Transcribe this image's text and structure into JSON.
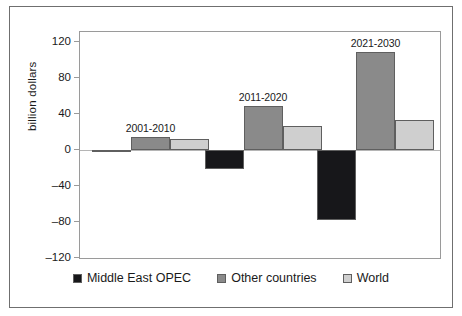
{
  "chart_data": {
    "type": "bar",
    "title": "",
    "xlabel": "",
    "ylabel": "billion dollars",
    "ylim": [
      -120,
      120
    ],
    "ytick_labels": [
      "120",
      "80",
      "40",
      "0",
      "–40",
      "–80",
      "–120"
    ],
    "ytick_values": [
      120,
      80,
      40,
      0,
      -40,
      -80,
      -120
    ],
    "grid": false,
    "legend_position": "bottom",
    "categories": [
      "2001-2010",
      "2011-2020",
      "2021-2030"
    ],
    "series": [
      {
        "name": "Middle East OPEC",
        "color": "#17171a",
        "values": [
          -2,
          -21,
          -78
        ]
      },
      {
        "name": "Other countries",
        "color": "#8a8a8a",
        "values": [
          14,
          49,
          109
        ]
      },
      {
        "name": "World",
        "color": "#cfcfcf",
        "values": [
          12,
          27,
          33
        ]
      }
    ]
  },
  "axis": {
    "y_title": "billion dollars"
  },
  "groups": [
    {
      "label": "2001-2010"
    },
    {
      "label": "2011-2020"
    },
    {
      "label": "2021-2030"
    }
  ],
  "legend": {
    "items": [
      {
        "label": "Middle East OPEC",
        "color": "#17171a"
      },
      {
        "label": "Other countries",
        "color": "#8a8a8a"
      },
      {
        "label": "World",
        "color": "#cfcfcf"
      }
    ]
  },
  "yticks": [
    {
      "label": "120",
      "value": 120
    },
    {
      "label": "80",
      "value": 80
    },
    {
      "label": "40",
      "value": 40
    },
    {
      "label": "0",
      "value": 0
    },
    {
      "label": "–40",
      "value": -40
    },
    {
      "label": "–80",
      "value": -80
    },
    {
      "label": "–120",
      "value": -120
    }
  ]
}
